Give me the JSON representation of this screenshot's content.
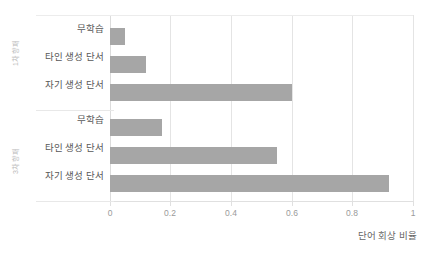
{
  "chart_data": {
    "type": "bar",
    "orientation": "horizontal",
    "title": "",
    "xlabel": "단어 회상 비율",
    "ylabel": "",
    "xlim": [
      0,
      1
    ],
    "xticks": [
      "0",
      "0.2",
      "0.4",
      "0.6",
      "0.8",
      "1"
    ],
    "xtick_values": [
      0,
      0.2,
      0.4,
      0.6,
      0.8,
      1
    ],
    "grid": true,
    "legend": "none",
    "bar_color": "#a6a6a6",
    "groups": [
      {
        "name": "1차 향패",
        "categories": [
          "무학습",
          "타인 생성 단서",
          "자기 생성 단서"
        ],
        "values": [
          0.05,
          0.12,
          0.6
        ]
      },
      {
        "name": "3차 향패",
        "categories": [
          "무학습",
          "타인 생성 단서",
          "자기 생성 단서"
        ],
        "values": [
          0.17,
          0.55,
          0.92
        ]
      }
    ],
    "categories": [
      "무학습",
      "타인 생성 단서",
      "자기 생성 단서",
      "무학습",
      "타인 생성 단서",
      "자기 생성 단서"
    ],
    "values": [
      0.05,
      0.12,
      0.6,
      0.17,
      0.55,
      0.92
    ]
  },
  "axis": {
    "x_title": "단어 회상 비율",
    "tick_0": "0",
    "tick_1": "0.2",
    "tick_2": "0.4",
    "tick_3": "0.6",
    "tick_4": "0.8",
    "tick_5": "1"
  },
  "group_labels": {
    "first": "1차 향패",
    "second": "3차 향패"
  },
  "labels": {
    "g1c1": "무학습",
    "g1c2": "타인 생성 단서",
    "g1c3": "자기 생성 단서",
    "g2c1": "무학습",
    "g2c2": "타인 생성 단서",
    "g2c3": "자기 생성 단서"
  }
}
